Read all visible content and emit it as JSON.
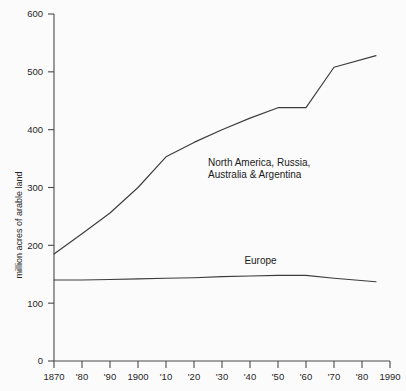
{
  "chart_data": {
    "type": "line",
    "title": "",
    "subtitle": "",
    "xlabel": "",
    "ylabel": "million acres of arable land",
    "xlim": [
      1870,
      1990
    ],
    "ylim": [
      0,
      600
    ],
    "grid": false,
    "legend_position": "inline-annotation",
    "x_tick_values": [
      1870,
      1880,
      1890,
      1900,
      1910,
      1920,
      1930,
      1940,
      1950,
      1960,
      1970,
      1980,
      1990
    ],
    "x_tick_labels": [
      "1870",
      "'80",
      "'90",
      "1900",
      "'10",
      "'20",
      "'30",
      "'40",
      "'50",
      "'60",
      "'70",
      "'80",
      "1990"
    ],
    "y_tick_values": [
      0,
      100,
      200,
      300,
      400,
      500,
      600
    ],
    "y_tick_labels": [
      "0",
      "100",
      "200",
      "300",
      "400",
      "500",
      "600"
    ],
    "series": [
      {
        "name": "North America, Russia, Australia & Argentina",
        "annotation_line1": "North America, Russia,",
        "annotation_line2": "Australia & Argentina",
        "color": "#3c3c3c",
        "x": [
          1870,
          1880,
          1890,
          1900,
          1910,
          1920,
          1930,
          1940,
          1950,
          1960,
          1970,
          1985
        ],
        "values": [
          185,
          220,
          256,
          300,
          353,
          378,
          400,
          420,
          438,
          438,
          508,
          528
        ]
      },
      {
        "name": "Europe",
        "annotation_line1": "Europe",
        "annotation_line2": "",
        "color": "#3c3c3c",
        "x": [
          1870,
          1880,
          1890,
          1900,
          1910,
          1920,
          1930,
          1940,
          1950,
          1960,
          1970,
          1985
        ],
        "values": [
          140,
          140,
          141,
          142,
          143,
          144,
          146,
          147,
          148,
          148,
          143,
          137
        ]
      }
    ],
    "annotations": [
      {
        "text_line1": "North America, Russia,",
        "text_line2": "Australia & Argentina",
        "x": 1925,
        "y": 338
      },
      {
        "text_line1": "Europe",
        "text_line2": "",
        "x": 1938,
        "y": 168
      }
    ]
  }
}
